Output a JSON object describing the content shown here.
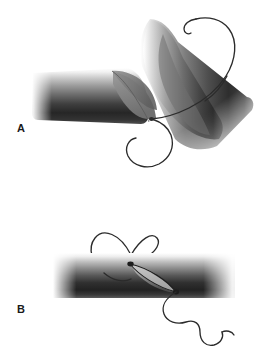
{
  "figure": {
    "background_color": "#ffffff",
    "width": 272,
    "height": 364,
    "panels": [
      {
        "id": "A",
        "label": "A",
        "label_x": 17,
        "label_y": 123,
        "description": "Obliquely cut tube with everted flap, angled tube segment at right, and curved suture thread passing through with a looping tail below",
        "elements": [
          {
            "name": "horizontal-tube",
            "kind": "cylinder",
            "x": 35,
            "y": 68,
            "width": 110,
            "height": 50,
            "rotation_deg": 8,
            "fade_left": true,
            "description": "Main horizontal tissue cylinder shaded from light at top to dark at bottom"
          },
          {
            "name": "tube-cut-flap",
            "kind": "flap",
            "description": "Obliquely cut, partly everted flap at the right end of the horizontal tube",
            "shade": "#7d7d7d"
          },
          {
            "name": "angled-tube",
            "kind": "cylinder",
            "x": 150,
            "y": 18,
            "width": 48,
            "height": 130,
            "rotation_deg": 38,
            "description": "Second tubular segment tipped up to the right with pointed upper end"
          },
          {
            "name": "suture-thread",
            "kind": "curve",
            "color": "#2b2b2b",
            "stroke_width": 1.4,
            "description": "Suture thread entering from upper right, passing through both tube walls, exiting with a large loop to the lower left"
          }
        ]
      },
      {
        "id": "B",
        "label": "B",
        "label_x": 17,
        "label_y": 304,
        "description": "Intact horizontal tube with lens-shaped opening and suture loop above and wavy thread tail below right",
        "elements": [
          {
            "name": "horizontal-tube",
            "kind": "cylinder",
            "x": 53,
            "y": 253,
            "width": 179,
            "height": 45,
            "rotation_deg": 0,
            "fade_left": true,
            "fade_right": true,
            "description": "Intact horizontal tissue cylinder shaded light at top to dark at bottom"
          },
          {
            "name": "lens-opening",
            "kind": "lens",
            "cx": 152,
            "cy": 275,
            "length": 62,
            "width": 17,
            "rotation_deg": 33,
            "description": "Lens or leaf-shaped slit opening across the tube wall"
          },
          {
            "name": "suture-loop",
            "kind": "loop",
            "cx": 122,
            "cy": 252,
            "rx": 26,
            "ry": 21,
            "description": "Oval loop of suture thread above the tube"
          },
          {
            "name": "suture-tail",
            "kind": "curve",
            "color": "#2b2b2b",
            "stroke_width": 1.4,
            "description": "Wavy suture tail exiting from the lower end of the slit toward the lower right"
          }
        ]
      }
    ],
    "colors": {
      "thread": "#2b2b2b",
      "tube_light": "#ffffff",
      "tube_mid": "#8a8a8a",
      "tube_dark": "#262626",
      "tube_bottom": "#4a4a4a",
      "flap": "#808080",
      "label_text": "#1a1a1a"
    }
  }
}
